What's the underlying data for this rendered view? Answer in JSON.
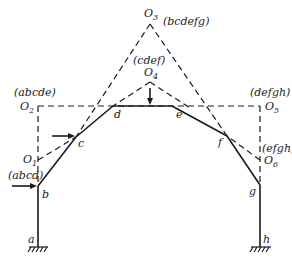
{
  "diagram": {
    "joints": {
      "a": "a",
      "b": "b",
      "c": "c",
      "d": "d",
      "e": "e",
      "f": "f",
      "g": "g",
      "h": "h"
    },
    "centers": {
      "O1": {
        "letter": "O",
        "sub": "1",
        "group": "(abcd)"
      },
      "O2": {
        "letter": "O",
        "sub": "2",
        "group": "(abcde)"
      },
      "O3": {
        "letter": "O",
        "sub": "3",
        "group": "(bcdefg)"
      },
      "O4": {
        "letter": "O",
        "sub": "4",
        "group": "(cdef)"
      },
      "O5": {
        "letter": "O",
        "sub": "5",
        "group": "(defgh)"
      },
      "O6": {
        "letter": "O",
        "sub": "6",
        "group": "(efgh)"
      }
    },
    "colors": {
      "line": "#1a1a1a",
      "background": "#ffffff"
    }
  }
}
